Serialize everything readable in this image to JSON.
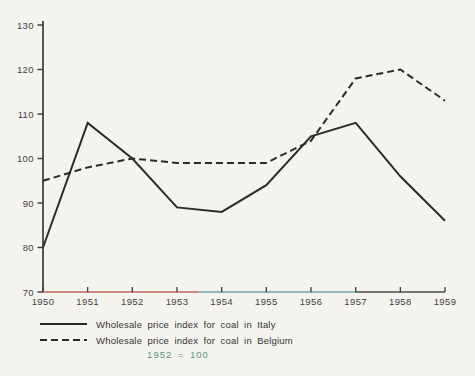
{
  "page": {
    "background": "#f4f3ee"
  },
  "chart_data": {
    "type": "line",
    "title": "",
    "xlabel": "",
    "ylabel": "",
    "x": [
      1950,
      1951,
      1952,
      1953,
      1954,
      1955,
      1956,
      1957,
      1958,
      1959
    ],
    "x_tick_labels": [
      "1950",
      "1951",
      "1952",
      "1953",
      "1954",
      "1955",
      "1956",
      "1957",
      "1958",
      "1959"
    ],
    "y_ticks": [
      70,
      80,
      90,
      100,
      110,
      120,
      130
    ],
    "ylim": [
      70,
      130
    ],
    "grid": false,
    "legend_position": "below-left",
    "series": [
      {
        "name": "Wholesale price index for coal in Italy",
        "line_style": "solid",
        "color": "#2b2b2b",
        "values": [
          80,
          108,
          100,
          89,
          88,
          94,
          105,
          108,
          96,
          86
        ]
      },
      {
        "name": "Wholesale price index for coal in Belgium",
        "line_style": "dashed",
        "color": "#2b2b2b",
        "values": [
          95,
          98,
          100,
          99,
          99,
          99,
          104,
          118,
          120,
          113
        ]
      }
    ],
    "note": "1952 = 100",
    "axis_color": "#3a3a3a",
    "tick_label_color": "#3f3f3f",
    "x_axis_segments": [
      {
        "from": 1950,
        "to": 1953.5,
        "color": "#c4635c"
      },
      {
        "from": 1953.5,
        "to": 1957,
        "color": "#68aaa5"
      },
      {
        "from": 1957,
        "to": 1959,
        "color": "#4a4a4a"
      }
    ]
  }
}
